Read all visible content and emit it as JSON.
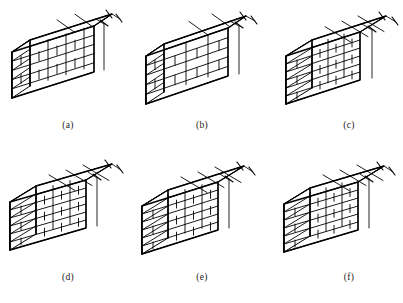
{
  "sheet": {
    "title": "Brick wall bond patterns — isometric views",
    "background_color": "#ffffff",
    "line_color": "#000000",
    "columns": 3,
    "rows": 2
  },
  "figures": [
    {
      "id": "a",
      "caption": "(a)",
      "description": "Single-leaf stretcher bond wall, thinnest wall, running bond with half-brick offset each course",
      "courses": 5,
      "thickness_class": "half-brick",
      "top_face": "narrow",
      "dimension_marks": 2
    },
    {
      "id": "b",
      "caption": "(b)",
      "description": "Stretcher bond wall with larger stretcher units in lower courses and stepped left end",
      "courses": 5,
      "thickness_class": "half-brick",
      "top_face": "narrow",
      "dimension_marks": 2
    },
    {
      "id": "c",
      "caption": "(c)",
      "description": "Thicker one-brick wall, header course visible on top face, running bond on face",
      "courses": 6,
      "thickness_class": "one-brick",
      "top_face": "wide",
      "dimension_marks": 2
    },
    {
      "id": "d",
      "caption": "(d)",
      "description": "One-brick wall with header bricks across the top face and stretcher bond on elevation",
      "courses": 6,
      "thickness_class": "one-brick",
      "top_face": "wide",
      "dimension_marks": 2
    },
    {
      "id": "e",
      "caption": "(e)",
      "description": "Mixed bond wall, alternating header and stretcher units on top course, stepped end",
      "courses": 6,
      "thickness_class": "one-brick",
      "top_face": "wide",
      "dimension_marks": 2
    },
    {
      "id": "f",
      "caption": "(f)",
      "description": "Thick wall with full header course on top face and regular running bond elevation",
      "courses": 6,
      "thickness_class": "one-brick",
      "top_face": "wide",
      "dimension_marks": 2
    }
  ]
}
